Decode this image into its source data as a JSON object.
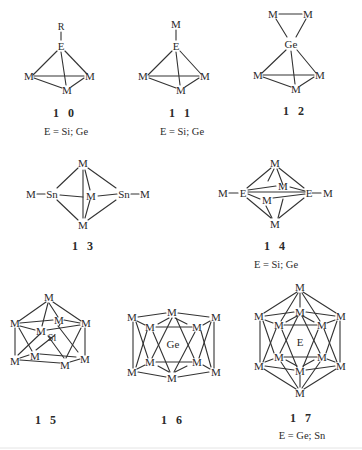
{
  "figure": {
    "structures": [
      {
        "id": "10",
        "label": "1 0",
        "caption": "E = Si; Ge",
        "atoms": [
          "R",
          "E",
          "M",
          "M",
          "M"
        ],
        "core": "E-capped M3 triangle"
      },
      {
        "id": "11",
        "label": "1 1",
        "caption": "E = Si; Ge",
        "atoms": [
          "M",
          "E",
          "M",
          "M",
          "M"
        ],
        "core": "E-capped M3 triangle"
      },
      {
        "id": "12",
        "label": "1 2",
        "caption": "",
        "atoms": [
          "M",
          "M",
          "Ge",
          "M",
          "M",
          "M"
        ],
        "core": "Ge spiro bridging M2 and M3"
      },
      {
        "id": "13",
        "label": "1 3",
        "caption": "",
        "atoms": [
          "M",
          "Sn",
          "M",
          "Sn",
          "M",
          "M",
          "M"
        ],
        "core": "Sn2M3 trigonal bipyramid"
      },
      {
        "id": "14",
        "label": "1 4",
        "caption": "E = Si; Ge",
        "atoms": [
          "M",
          "E",
          "M",
          "M",
          "E",
          "M",
          "M",
          "M"
        ],
        "core": "E2M4 octahedron"
      },
      {
        "id": "15",
        "label": "1 5",
        "caption": "",
        "atoms": [
          "M",
          "M",
          "M",
          "M",
          "M",
          "Si",
          "M",
          "M",
          "M",
          "M"
        ],
        "core": "Si in M9 cage"
      },
      {
        "id": "16",
        "label": "1 6",
        "caption": "",
        "atoms": [
          "M",
          "M",
          "M",
          "M",
          "M",
          "Ge",
          "M",
          "M",
          "M",
          "M",
          "M",
          "M"
        ],
        "core": "Ge in M10 pentagonal antiprism"
      },
      {
        "id": "17",
        "label": "1 7",
        "caption": "E = Ge; Sn",
        "atoms": [
          "M",
          "M",
          "M",
          "M",
          "M",
          "E",
          "M",
          "M",
          "M",
          "M",
          "M",
          "M",
          "M"
        ],
        "core": "E in M12 icosahedron"
      }
    ]
  },
  "labels": {
    "s10": {
      "R": "R",
      "E": "E",
      "M": "M",
      "num": "1 0",
      "cap": "E = Si; Ge"
    },
    "s11": {
      "Mtop": "M",
      "E": "E",
      "M": "M",
      "num": "1 1",
      "cap": "E = Si; Ge"
    },
    "s12": {
      "M": "M",
      "Ge": "Ge",
      "num": "1 2"
    },
    "s13": {
      "M": "M",
      "Sn": "Sn",
      "num": "1 3"
    },
    "s14": {
      "M": "M",
      "E": "E",
      "num": "1 4",
      "cap": "E = Si; Ge"
    },
    "s15": {
      "M": "M",
      "Si": "Si",
      "num": "1 5"
    },
    "s16": {
      "M": "M",
      "Ge": "Ge",
      "num": "1 6"
    },
    "s17": {
      "M": "M",
      "E": "E",
      "num": "1 7",
      "cap": "E = Ge; Sn"
    }
  }
}
